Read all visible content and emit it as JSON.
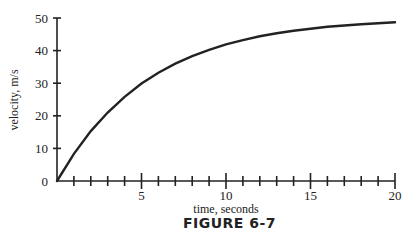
{
  "chart_data": {
    "type": "line",
    "title": "",
    "caption": "FIGURE 6-7",
    "xlabel": "time, seconds",
    "ylabel": "velocity, m/s",
    "xlim": [
      0,
      20
    ],
    "ylim": [
      0,
      50
    ],
    "x_ticks_major": [
      5,
      10,
      15,
      20
    ],
    "x_ticks_minor_step": 1,
    "y_ticks": [
      0,
      10,
      20,
      30,
      40,
      50
    ],
    "grid": false,
    "legend": null,
    "series": [
      {
        "name": "velocity",
        "x": [
          0,
          1,
          2,
          3,
          4,
          5,
          6,
          7,
          8,
          9,
          10,
          11,
          12,
          13,
          14,
          15,
          16,
          17,
          18,
          19,
          20
        ],
        "values": [
          0,
          8.3,
          15.3,
          21.0,
          25.8,
          29.9,
          33.2,
          36.0,
          38.3,
          40.2,
          41.9,
          43.2,
          44.4,
          45.3,
          46.1,
          46.7,
          47.3,
          47.7,
          48.1,
          48.4,
          48.7
        ]
      }
    ]
  }
}
